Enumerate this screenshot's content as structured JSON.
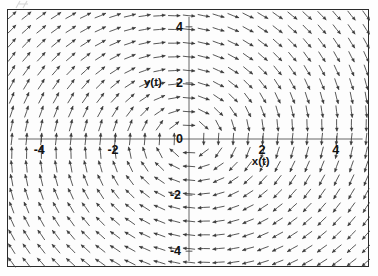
{
  "figure": {
    "kind": "direction-field",
    "frame_visible": true,
    "background_color": "#fdfdfd",
    "frame_color": "#2b2b2b",
    "arrow_color": "#3a3a3a",
    "axis_color": "#555555",
    "text_color": "#111111"
  },
  "axes": {
    "x_axis_label": "x(t)",
    "y_axis_label": "y(t)",
    "x_ticks": [
      "-4",
      "-2",
      "0",
      "2",
      "4"
    ],
    "y_ticks": [
      "4",
      "2",
      "0",
      "-2",
      "-4"
    ],
    "x_tick_values": [
      -4,
      -2,
      0,
      2,
      4
    ],
    "y_tick_values": [
      4,
      2,
      0,
      -2,
      -4
    ],
    "origin_label": "0"
  },
  "chart_data": {
    "type": "scatter",
    "subtype": "vector-field",
    "title": "",
    "subtitle": "",
    "xlabel": "x(t)",
    "ylabel": "y(t)",
    "xlim": [
      -4.9,
      4.9
    ],
    "ylim": [
      -4.6,
      4.6
    ],
    "xticks": [
      -4,
      -2,
      0,
      2,
      4
    ],
    "yticks": [
      -4,
      -2,
      0,
      -2,
      4
    ],
    "xticklabels": [
      "-4",
      "-2",
      "0",
      "2",
      "4"
    ],
    "yticklabels": [
      "-4",
      "-2",
      "0",
      "2",
      "4"
    ],
    "grid": false,
    "legend": null,
    "legend_position": "none",
    "annotations": [
      "x(t)",
      "y(t)",
      "0"
    ],
    "field": {
      "description": "counterclockwise spiral/center at origin",
      "u_expression": "y - 0.10*x*(x*x + y*y)/(1 + x*x + y*y)",
      "v_expression": "-x - 0.10*y*(x*x + y*y)/(1 + x*x + y*y)",
      "grid_nx": 25,
      "grid_ny": 19,
      "x_start": -4.8,
      "x_end": 4.8,
      "y_start": -4.4,
      "y_end": 4.4,
      "arrow_length_px": 11.5,
      "arrow_head_px": 3.4,
      "normalized": true
    },
    "equilibria": [
      {
        "x": 0,
        "y": 0,
        "type": "center"
      }
    ]
  }
}
